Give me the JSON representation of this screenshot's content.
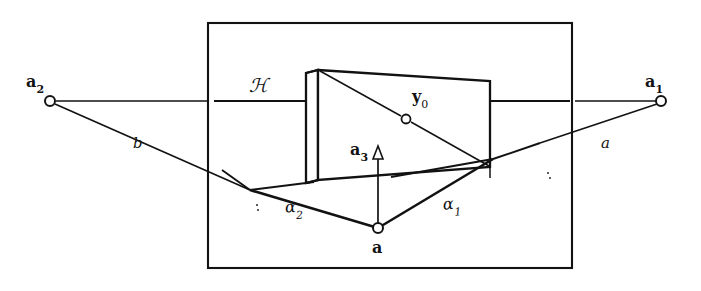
{
  "figure": {
    "kind": "geometric-diagram",
    "stroke_color": "#121212",
    "background_color": "#ffffff"
  },
  "labels": {
    "a2": {
      "base": "a",
      "sub": "2",
      "x": 26,
      "y": 74
    },
    "a1": {
      "base": "a",
      "sub": "1",
      "x": 645,
      "y": 74
    },
    "a3": {
      "base": "a",
      "sub": "3",
      "x": 350,
      "y": 142
    },
    "a_vertex": {
      "base": "a",
      "sub": "",
      "x": 377,
      "y": 245
    },
    "y0": {
      "base": "y",
      "sub": "0",
      "x": 412,
      "y": 89
    },
    "H": {
      "base": "ℋ",
      "sub": "",
      "x": 249,
      "y": 78
    },
    "alpha1": {
      "base": "α",
      "sub": "1",
      "x": 443,
      "y": 196
    },
    "alpha2": {
      "base": "α",
      "sub": "2",
      "x": 285,
      "y": 199
    },
    "ray_a": {
      "base": "a",
      "sub": "",
      "x": 601,
      "y": 138
    },
    "ray_b": {
      "base": "b",
      "sub": "",
      "x": 133,
      "y": 140
    }
  },
  "points": {
    "a2_marker": {
      "cx": 50,
      "cy": 101,
      "r": 5.0
    },
    "a1_marker": {
      "cx": 661,
      "cy": 101,
      "r": 5.0
    },
    "y0_marker": {
      "cx": 406,
      "cy": 119,
      "r": 4.5
    },
    "a_marker": {
      "cx": 378,
      "cy": 228,
      "r": 5.0
    }
  },
  "geometry": {
    "outer_rect": {
      "x": 208,
      "y": 23,
      "w": 364,
      "h": 245
    },
    "box_front": [
      [
        318,
        70
      ],
      [
        490,
        81
      ],
      [
        490,
        167
      ],
      [
        318,
        180
      ]
    ],
    "box_depth_offset": {
      "dx": -10,
      "dy": 3
    },
    "ground_left_vertex": {
      "x": 250,
      "y": 190
    },
    "ground_right_vertex": {
      "x": 493,
      "y": 159
    },
    "ground_apex": {
      "x": 378,
      "y": 228
    },
    "hyperplane_line_y": 101,
    "a3_arrow_top": {
      "x": 378,
      "y": 148
    }
  }
}
